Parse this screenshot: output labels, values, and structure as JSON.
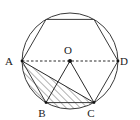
{
  "figure": {
    "background_color": "#ffffff",
    "stroke_color": "#3a3a3a",
    "label_color": "#1a1a1a",
    "hatch_color": "#555555",
    "circle": {
      "name": "circumscribed-circle",
      "center_x": 70,
      "center_y": 61,
      "radius": 48
    },
    "center_point": {
      "name": "center-O",
      "label": "O",
      "x": 70,
      "y": 61,
      "label_x": 68,
      "label_y": 54,
      "dot_radius": 2.0
    },
    "hexagon": {
      "name": "inscribed-hexagon",
      "sides": 6,
      "points": "22,61 46,19.4 94,19.4 118,61 94,102.6 46,102.6"
    },
    "points": [
      {
        "id": "A",
        "label": "A",
        "x": 22,
        "y": 61,
        "label_x": 9,
        "label_y": 65
      },
      {
        "id": "B",
        "label": "B",
        "x": 46,
        "y": 102.6,
        "label_x": 42,
        "label_y": 117
      },
      {
        "id": "C",
        "label": "C",
        "x": 94,
        "y": 102.6,
        "label_x": 91,
        "label_y": 117
      },
      {
        "id": "D",
        "label": "D",
        "x": 118,
        "y": 61,
        "label_x": 124,
        "label_y": 65
      }
    ],
    "diameter": {
      "name": "diameter-AD",
      "from": "A",
      "to": "D",
      "x1": 22,
      "y1": 61,
      "x2": 118,
      "y2": 61,
      "style": "dashed"
    },
    "radii": [
      {
        "name": "radius-OB",
        "from": "O",
        "to": "B",
        "x1": 70,
        "y1": 61,
        "x2": 46,
        "y2": 102.6,
        "style": "solid"
      },
      {
        "name": "radius-OC",
        "from": "O",
        "to": "C",
        "x1": 70,
        "y1": 61,
        "x2": 94,
        "y2": 102.6,
        "style": "solid"
      }
    ],
    "chords": [
      {
        "name": "chord-AC",
        "from": "A",
        "to": "C",
        "x1": 22,
        "y1": 61,
        "x2": 94,
        "y2": 102.6,
        "style": "solid"
      }
    ],
    "shaded_region": {
      "name": "shaded-circular-segment-ABC",
      "description": "Region bounded by chord AC and arc A-B-C",
      "fill": "hatch-diagonal",
      "path": "M 22 61 L 94 102.6 A 48 48 0 0 1 22 61 Z"
    }
  }
}
